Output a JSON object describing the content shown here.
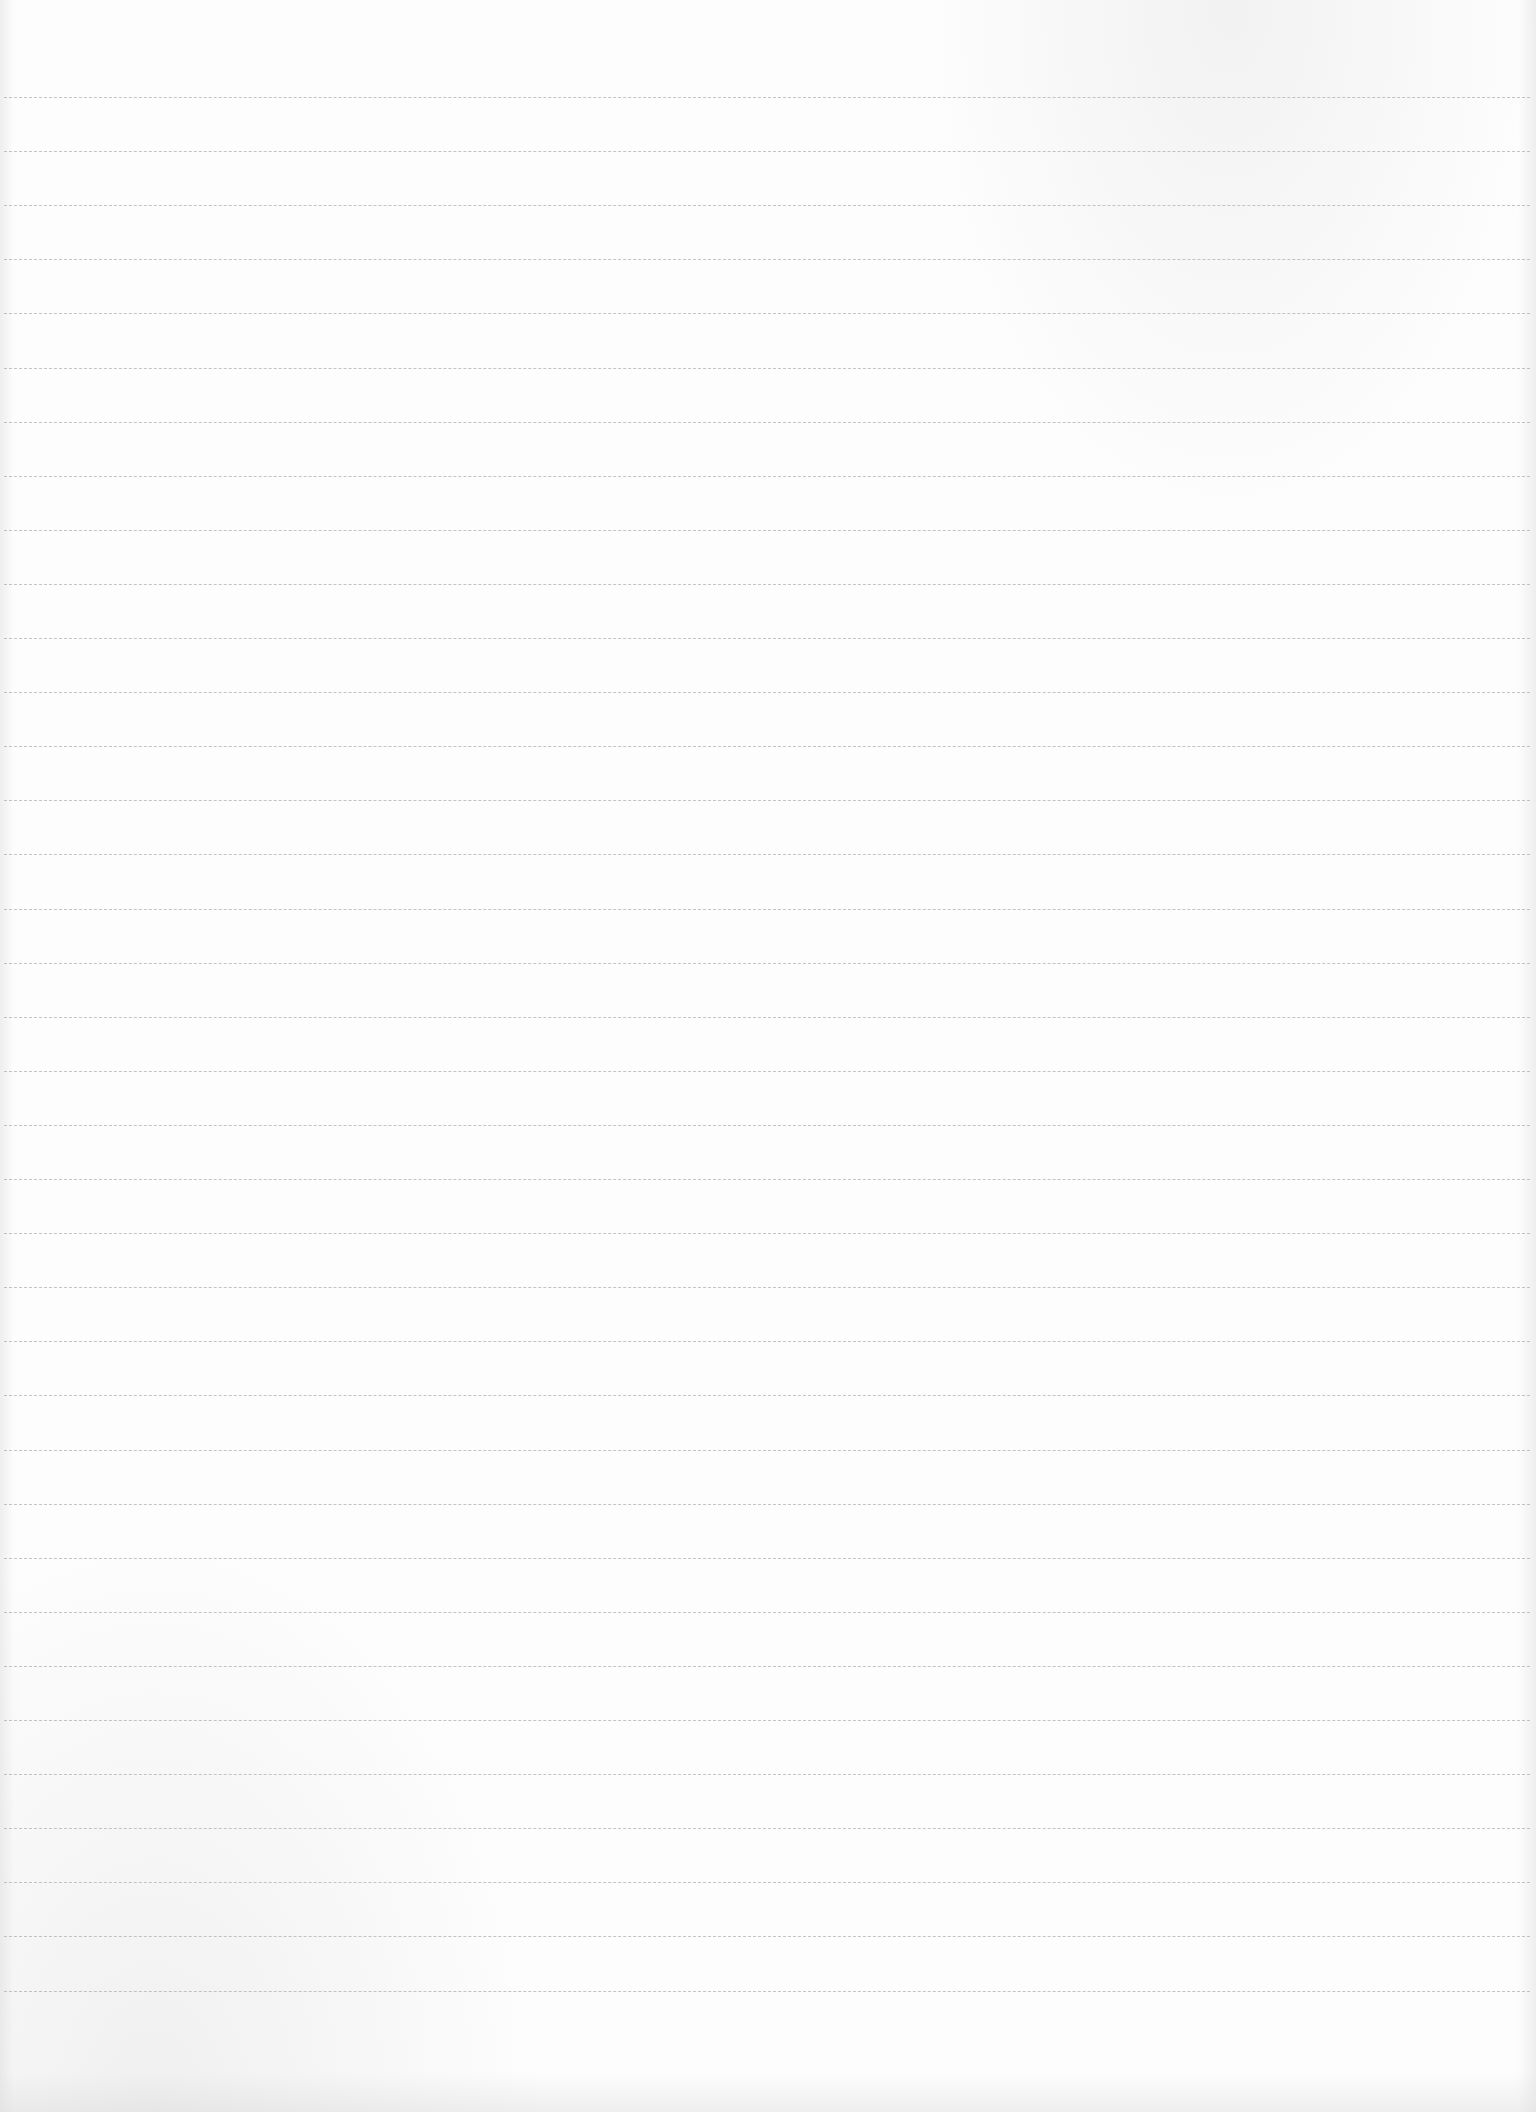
{
  "page": {
    "type": "lined-paper",
    "background_color": "#fdfdfd",
    "rule_color": "#b9b9b9",
    "content_text": ""
  },
  "rules": {
    "count": 36,
    "first_y": 97,
    "spacing": 54.1
  }
}
